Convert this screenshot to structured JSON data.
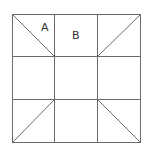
{
  "diagram": {
    "type": "grid-figure",
    "grid": {
      "rows": 3,
      "cols": 3,
      "left": 12,
      "top": 14,
      "cell": 42.7,
      "line_color": "#6a6a6a"
    },
    "labels": [
      {
        "text": "A",
        "x": 41,
        "y": 31
      },
      {
        "text": "B",
        "x": 72,
        "y": 39
      }
    ],
    "diagonals": [
      {
        "from": "top-left corner",
        "to": "inner top-left intersection"
      },
      {
        "from": "top-right corner",
        "to": "inner top-right intersection"
      },
      {
        "from": "bottom-left corner",
        "to": "inner bottom-left intersection"
      },
      {
        "from": "bottom-right corner",
        "to": "inner bottom-right intersection"
      }
    ]
  }
}
